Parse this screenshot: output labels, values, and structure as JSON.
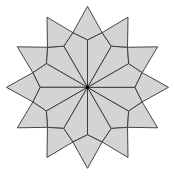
{
  "figure": {
    "center": [
      87.5,
      87.3
    ],
    "points": 12,
    "start_angle_deg": 90,
    "tip_radius": 81,
    "shoulder_radius": 56.6,
    "inner_radius": 47.5,
    "fill_color": "#d4d4d4",
    "stroke_color": "#333333",
    "stroke_width": 0.9,
    "center_dot_radius": 1.6,
    "center_dot_color": "#000000"
  }
}
